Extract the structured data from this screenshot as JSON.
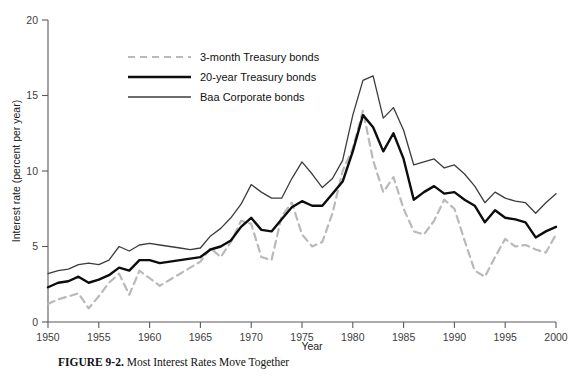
{
  "figure": {
    "caption_prefix": "FIGURE 9-2.",
    "caption_text": "Most Interest Rates Move Together"
  },
  "chart_data": {
    "type": "line",
    "title": "",
    "xlabel": "Year",
    "ylabel": "Interest rate (percent per year)",
    "xlim": [
      1950,
      2000
    ],
    "ylim": [
      0,
      20
    ],
    "xticks": [
      1950,
      1955,
      1960,
      1965,
      1970,
      1975,
      1980,
      1985,
      1990,
      1995,
      2000
    ],
    "yticks": [
      0,
      5,
      10,
      15,
      20
    ],
    "grid": false,
    "legend_position": "upper-center-left",
    "x": [
      1950,
      1951,
      1952,
      1953,
      1954,
      1955,
      1956,
      1957,
      1958,
      1959,
      1960,
      1961,
      1962,
      1963,
      1964,
      1965,
      1966,
      1967,
      1968,
      1969,
      1970,
      1971,
      1972,
      1973,
      1974,
      1975,
      1976,
      1977,
      1978,
      1979,
      1980,
      1981,
      1982,
      1983,
      1984,
      1985,
      1986,
      1987,
      1988,
      1989,
      1990,
      1991,
      1992,
      1993,
      1994,
      1995,
      1996,
      1997,
      1998,
      1999,
      2000
    ],
    "series": [
      {
        "name": "3-month Treasury bonds",
        "style": "dashed",
        "color": "#b9b9b9",
        "width": 2.2,
        "values": [
          1.2,
          1.5,
          1.7,
          1.9,
          0.9,
          1.7,
          2.6,
          3.2,
          1.8,
          3.4,
          2.9,
          2.4,
          2.8,
          3.2,
          3.6,
          4.0,
          4.9,
          4.3,
          5.3,
          6.7,
          6.5,
          4.3,
          4.1,
          7.0,
          7.9,
          5.8,
          5.0,
          5.3,
          7.2,
          10.0,
          11.5,
          14.0,
          10.7,
          8.6,
          9.6,
          7.5,
          6.0,
          5.8,
          6.7,
          8.1,
          7.5,
          5.4,
          3.4,
          3.0,
          4.3,
          5.5,
          5.0,
          5.1,
          4.8,
          4.6,
          5.8
        ]
      },
      {
        "name": "20-year Treasury bonds",
        "style": "solid",
        "color": "#0d0d0d",
        "width": 2.4,
        "values": [
          2.3,
          2.6,
          2.7,
          3.0,
          2.6,
          2.8,
          3.1,
          3.6,
          3.4,
          4.1,
          4.1,
          3.9,
          4.0,
          4.1,
          4.2,
          4.3,
          4.8,
          5.0,
          5.4,
          6.3,
          6.9,
          6.1,
          6.0,
          6.8,
          7.6,
          8.0,
          7.7,
          7.7,
          8.5,
          9.3,
          11.3,
          13.7,
          12.9,
          11.3,
          12.5,
          10.8,
          8.1,
          8.6,
          9.0,
          8.5,
          8.6,
          8.1,
          7.7,
          6.6,
          7.4,
          6.9,
          6.8,
          6.6,
          5.6,
          6.0,
          6.3
        ]
      },
      {
        "name": "Baa Corporate bonds",
        "style": "solid",
        "color": "#3c3c3c",
        "width": 1.3,
        "values": [
          3.2,
          3.4,
          3.5,
          3.8,
          3.9,
          3.8,
          4.1,
          5.0,
          4.7,
          5.1,
          5.2,
          5.1,
          5.0,
          4.9,
          4.8,
          4.9,
          5.7,
          6.2,
          6.9,
          7.8,
          9.1,
          8.6,
          8.2,
          8.2,
          9.5,
          10.6,
          9.8,
          8.9,
          9.5,
          10.7,
          13.7,
          16.0,
          16.3,
          13.5,
          14.2,
          12.7,
          10.4,
          10.6,
          10.8,
          10.2,
          10.4,
          9.8,
          9.0,
          7.9,
          8.6,
          8.2,
          8.0,
          7.9,
          7.2,
          7.9,
          8.5
        ]
      }
    ]
  }
}
